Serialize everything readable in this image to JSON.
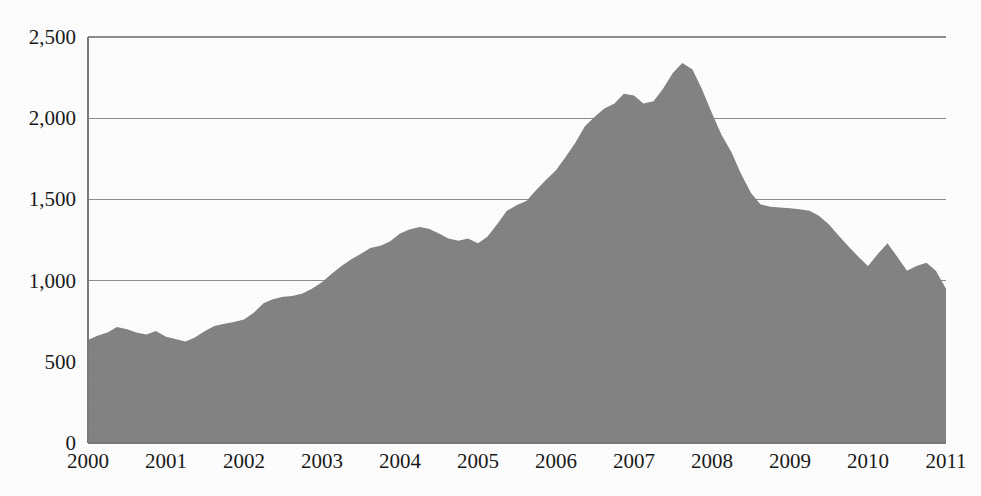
{
  "chart_data": {
    "type": "area",
    "title": "",
    "subtitle": "",
    "xlabel": "",
    "ylabel": "",
    "ylim": [
      0,
      2500
    ],
    "xlim": [
      2000,
      2011
    ],
    "grid": true,
    "legend": false,
    "legend_position": "none",
    "series_color": "#848484",
    "y_ticks": [
      "0",
      "500",
      "1,000",
      "1,500",
      "2,000",
      "2,500"
    ],
    "y_tick_values": [
      0,
      500,
      1000,
      1500,
      2000,
      2500
    ],
    "categories": [
      "2000",
      "2001",
      "2002",
      "2003",
      "2004",
      "2005",
      "2006",
      "2007",
      "2008",
      "2009",
      "2010",
      "2011"
    ],
    "series": [
      {
        "name": "series-1",
        "x": [
          2000.0,
          2000.12,
          2000.25,
          2000.37,
          2000.5,
          2000.62,
          2000.75,
          2000.87,
          2001.0,
          2001.12,
          2001.25,
          2001.37,
          2001.5,
          2001.62,
          2001.75,
          2001.87,
          2002.0,
          2002.12,
          2002.25,
          2002.37,
          2002.5,
          2002.62,
          2002.75,
          2002.87,
          2003.0,
          2003.12,
          2003.25,
          2003.37,
          2003.5,
          2003.62,
          2003.75,
          2003.87,
          2004.0,
          2004.12,
          2004.25,
          2004.37,
          2004.5,
          2004.62,
          2004.75,
          2004.87,
          2005.0,
          2005.12,
          2005.25,
          2005.37,
          2005.5,
          2005.62,
          2005.75,
          2005.87,
          2006.0,
          2006.12,
          2006.25,
          2006.37,
          2006.5,
          2006.62,
          2006.75,
          2006.87,
          2007.0,
          2007.12,
          2007.25,
          2007.37,
          2007.5,
          2007.62,
          2007.75,
          2007.87,
          2008.0,
          2008.12,
          2008.25,
          2008.37,
          2008.5,
          2008.62,
          2008.75,
          2008.87,
          2009.0,
          2009.12,
          2009.25,
          2009.37,
          2009.5,
          2009.62,
          2009.75,
          2009.87,
          2010.0,
          2010.12,
          2010.25,
          2010.37,
          2010.5,
          2010.62,
          2010.75,
          2010.87,
          2011.0
        ],
        "values": [
          635,
          660,
          680,
          715,
          700,
          680,
          668,
          690,
          655,
          640,
          625,
          650,
          690,
          720,
          735,
          745,
          760,
          800,
          860,
          885,
          900,
          905,
          920,
          950,
          990,
          1040,
          1090,
          1130,
          1165,
          1200,
          1215,
          1240,
          1290,
          1315,
          1330,
          1320,
          1290,
          1260,
          1245,
          1260,
          1230,
          1270,
          1350,
          1430,
          1465,
          1490,
          1560,
          1620,
          1680,
          1760,
          1850,
          1950,
          2010,
          2060,
          2090,
          2150,
          2140,
          2090,
          2105,
          2180,
          2280,
          2340,
          2300,
          2180,
          2030,
          1900,
          1790,
          1660,
          1540,
          1470,
          1455,
          1450,
          1445,
          1440,
          1430,
          1400,
          1345,
          1280,
          1210,
          1150,
          1090,
          1160,
          1230,
          1150,
          1060,
          1090,
          1110,
          1060,
          950
        ]
      }
    ]
  },
  "caption": {
    "text": ""
  }
}
